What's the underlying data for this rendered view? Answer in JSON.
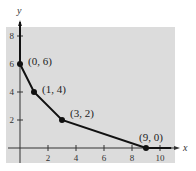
{
  "chart_data": {
    "type": "line",
    "title": "",
    "xlabel": "x",
    "ylabel": "y",
    "xlim": [
      0,
      11
    ],
    "ylim": [
      0,
      9
    ],
    "grid": false,
    "x_ticks": [
      2,
      4,
      6,
      8,
      10
    ],
    "y_ticks": [
      2,
      4,
      6,
      8
    ],
    "series": [
      {
        "name": "boundary",
        "points": [
          {
            "x": 0,
            "y": 6,
            "label": "(0, 6)"
          },
          {
            "x": 1,
            "y": 4,
            "label": "(1, 4)"
          },
          {
            "x": 3,
            "y": 2,
            "label": "(3, 2)"
          },
          {
            "x": 9,
            "y": 0,
            "label": "(9, 0)"
          }
        ],
        "extends_along_x_axis_to": 10.8
      }
    ],
    "shaded_region": "region above/right of boundary in first quadrant",
    "colors": {
      "panel": "#dcdcdc",
      "line": "#111111",
      "axis": "#333333"
    }
  }
}
